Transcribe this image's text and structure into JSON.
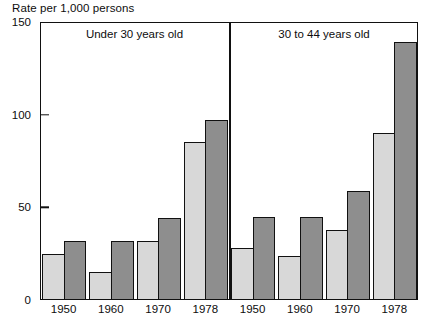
{
  "chart_data": {
    "type": "bar",
    "title": "Rate per 1,000 persons",
    "xlabel": "",
    "ylabel": "Rate per 1,000 persons",
    "ylim": [
      0,
      150
    ],
    "yticks": [
      0,
      50,
      100,
      150
    ],
    "grid": false,
    "legend": "none",
    "categories": [
      "1950",
      "1960",
      "1970",
      "1978"
    ],
    "panels": [
      {
        "label": "Under 30 years old",
        "series": [
          {
            "name": "light",
            "values": [
              25,
              15,
              32,
              85
            ]
          },
          {
            "name": "dark",
            "values": [
              32,
              32,
              44,
              97
            ]
          }
        ]
      },
      {
        "label": "30 to 44 years old",
        "series": [
          {
            "name": "light",
            "values": [
              28,
              24,
              38,
              90
            ]
          },
          {
            "name": "dark",
            "values": [
              45,
              45,
              59,
              139
            ]
          }
        ]
      }
    ],
    "colors": {
      "light_bar": "#d8d8d8",
      "dark_bar": "#8e8e8e",
      "axis": "#111111",
      "background": "#ffffff"
    }
  },
  "axis": {
    "y_labels": [
      "150",
      "100",
      "50",
      "0"
    ]
  },
  "footer": {
    "note": ""
  }
}
